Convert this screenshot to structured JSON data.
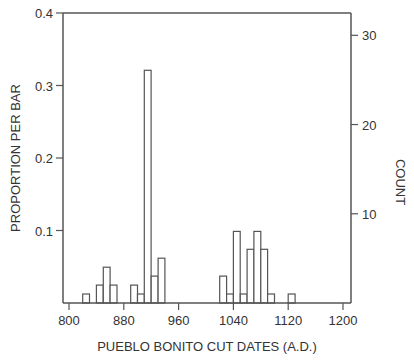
{
  "chart_data": {
    "type": "bar",
    "subtype": "histogram",
    "title": "",
    "xlabel": "PUEBLO BONITO CUT DATES (A.D.)",
    "ylabel_left": "PROPORTION PER BAR",
    "ylabel_right": "COUNT",
    "xlim": [
      800,
      1200
    ],
    "ylim_left": [
      0,
      0.4
    ],
    "ylim_right": [
      0,
      32.5
    ],
    "bin_width": 10,
    "total_count": 81,
    "x_ticks": [
      800,
      880,
      960,
      1040,
      1120,
      1200
    ],
    "x_tick_labels": [
      "800",
      "880",
      "960",
      "1040",
      "1120",
      "1200"
    ],
    "y_left_ticks": [
      0.1,
      0.2,
      0.3,
      0.4
    ],
    "y_left_tick_labels": [
      "0.1",
      "0.2",
      "0.3",
      "0.4"
    ],
    "y_right_ticks": [
      10,
      20,
      30
    ],
    "y_right_tick_labels": [
      "10",
      "20",
      "30"
    ],
    "grid": false,
    "bins": [
      {
        "start": 820,
        "count": 1
      },
      {
        "start": 840,
        "count": 2
      },
      {
        "start": 850,
        "count": 4
      },
      {
        "start": 860,
        "count": 2
      },
      {
        "start": 890,
        "count": 2
      },
      {
        "start": 900,
        "count": 1
      },
      {
        "start": 910,
        "count": 26
      },
      {
        "start": 920,
        "count": 3
      },
      {
        "start": 930,
        "count": 5
      },
      {
        "start": 1020,
        "count": 3
      },
      {
        "start": 1030,
        "count": 1
      },
      {
        "start": 1040,
        "count": 8
      },
      {
        "start": 1050,
        "count": 1
      },
      {
        "start": 1060,
        "count": 6
      },
      {
        "start": 1070,
        "count": 8
      },
      {
        "start": 1080,
        "count": 6
      },
      {
        "start": 1090,
        "count": 1
      },
      {
        "start": 1120,
        "count": 1
      }
    ],
    "colors": {
      "axis": "#555555",
      "bar_stroke": "#555555",
      "bar_fill": "#ffffff",
      "text": "#333333"
    }
  }
}
